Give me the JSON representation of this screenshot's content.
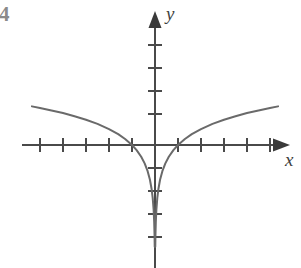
{
  "figure": {
    "number_label": "4",
    "background_color": "#ffffff"
  },
  "axes": {
    "x_label": "x",
    "y_label": "y",
    "axis_color": "#4a4a4a",
    "origin_px": {
      "x": 155,
      "y": 145
    },
    "unit_px": 23,
    "x_axis": {
      "line_from_px": 22,
      "line_to_px": 285,
      "arrow": "right",
      "ticks_units": [
        -5,
        -4,
        -3,
        -2,
        -1,
        1,
        2,
        3,
        4,
        5
      ],
      "tick_half_length_px": 7
    },
    "y_axis": {
      "line_from_px": 12,
      "line_to_px": 268,
      "arrow": "up",
      "ticks_units": [
        4,
        3,
        2,
        1,
        -1,
        -2,
        -3,
        -4
      ],
      "tick_half_length_px": 7
    }
  },
  "chart_data": {
    "type": "line",
    "title": "",
    "xlabel": "x",
    "ylabel": "y",
    "grid": false,
    "legend": null,
    "function": "y = ln|x|",
    "curve_color": "#6a6a6a",
    "curve_width_px": 2,
    "xlim": [
      -5.8,
      5.4
    ],
    "ylim": [
      -4.6,
      4.6
    ],
    "x_intercepts": [
      -1,
      1
    ],
    "asymptote": {
      "type": "vertical",
      "x": 0
    },
    "symmetry": "even",
    "series": [
      {
        "name": "y = ln|x| (left branch, x < 0)",
        "x": [
          -5.35,
          -5.0,
          -4.5,
          -4.0,
          -3.5,
          -3.0,
          -2.5,
          -2.0,
          -1.6,
          -1.3,
          -1.0,
          -0.8,
          -0.6,
          -0.45,
          -0.32,
          -0.22,
          -0.15,
          -0.1,
          -0.06,
          -0.035,
          -0.02,
          -0.012
        ],
        "y": [
          1.68,
          1.61,
          1.5,
          1.39,
          1.25,
          1.1,
          0.92,
          0.69,
          0.47,
          0.26,
          0.0,
          -0.22,
          -0.51,
          -0.8,
          -1.14,
          -1.51,
          -1.9,
          -2.3,
          -2.81,
          -3.35,
          -3.91,
          -4.42
        ]
      },
      {
        "name": "y = ln|x| (right branch, x > 0)",
        "x": [
          0.012,
          0.02,
          0.035,
          0.06,
          0.1,
          0.15,
          0.22,
          0.32,
          0.45,
          0.6,
          0.8,
          1.0,
          1.3,
          1.6,
          2.0,
          2.5,
          3.0,
          3.5,
          4.0,
          4.5,
          5.0,
          5.35
        ],
        "y": [
          -4.42,
          -3.91,
          -3.35,
          -2.81,
          -2.3,
          -1.9,
          -1.51,
          -1.14,
          -0.8,
          -0.51,
          -0.22,
          0.0,
          0.26,
          0.47,
          0.69,
          0.92,
          1.1,
          1.25,
          1.39,
          1.5,
          1.61,
          1.68
        ]
      }
    ]
  }
}
